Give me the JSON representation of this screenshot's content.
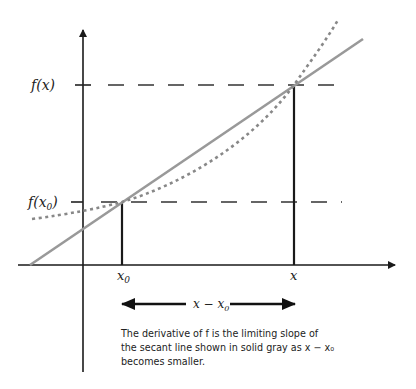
{
  "diagram": {
    "type": "secant-line-derivative",
    "labels": {
      "fx": "f(x)",
      "fx0_f": "f(x",
      "fx0_sub": "0",
      "fx0_close": ")",
      "x0": "x",
      "x0_sub": "0",
      "x": "x",
      "interval": "x − x",
      "interval_sub": "0"
    },
    "colors": {
      "axes": "#1a1a1a",
      "secant": "#999999",
      "curve": "#888888",
      "dashes": "#333333"
    }
  },
  "caption": {
    "line1": "The derivative of f is the limiting slope of",
    "line2": "the secant line shown in solid gray as x − x₀",
    "line3": "becomes smaller."
  }
}
